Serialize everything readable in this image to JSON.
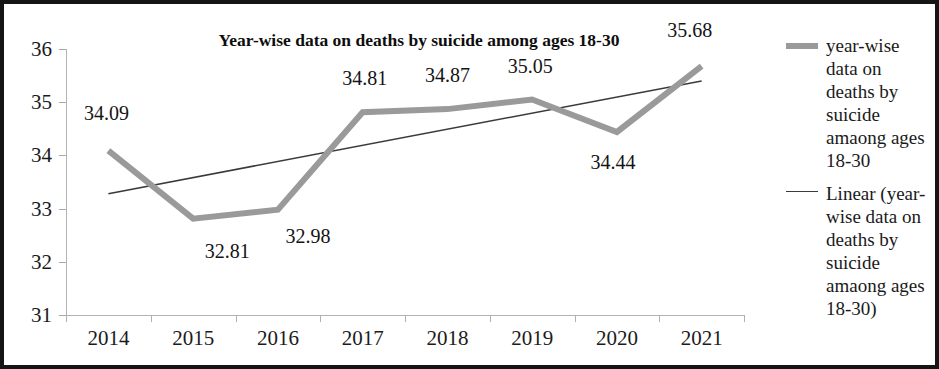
{
  "chart_data": {
    "type": "line",
    "title": "Year-wise data on deaths by suicide among ages 18-30",
    "xlabel": "",
    "ylabel": "",
    "categories": [
      "2014",
      "2015",
      "2016",
      "2017",
      "2018",
      "2019",
      "2020",
      "2021"
    ],
    "ylim": [
      31,
      36
    ],
    "yticks": [
      "31",
      "32",
      "33",
      "34",
      "35",
      "36"
    ],
    "grid": false,
    "legend_position": "right",
    "series": [
      {
        "name": "year-wise data on deaths by suicide amaong ages 18-30",
        "type": "line",
        "color": "#9a9a9a",
        "width": 6,
        "values": [
          34.09,
          32.81,
          32.98,
          34.81,
          34.87,
          35.05,
          34.44,
          35.68
        ],
        "labels": [
          "34.09",
          "32.81",
          "32.98",
          "34.81",
          "34.87",
          "35.05",
          "34.44",
          "35.68"
        ]
      },
      {
        "name": "Linear (year-wise data on deaths by suicide amaong ages 18-30)",
        "type": "trendline",
        "color": "#3a3a3a",
        "width": 1.5,
        "endpoints": [
          33.28,
          35.4
        ]
      }
    ]
  },
  "legend": {
    "entries": [
      {
        "marker": "thick-gray-line",
        "label": "year-wise data on deaths by suicide amaong ages 18-30"
      },
      {
        "marker": "thin-dark-line",
        "label": "Linear (year-wise data on deaths by suicide amaong ages 18-30)"
      }
    ]
  }
}
